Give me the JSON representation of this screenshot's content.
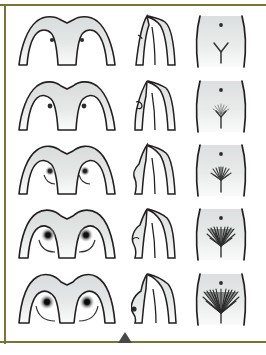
{
  "figure": {
    "type": "medical-development-stage-chart",
    "title": "",
    "frame": {
      "rule_color": "#7b7333",
      "marker_color": "#474747",
      "marker_shape": "triangle-up",
      "background": "#ffffff"
    },
    "render": {
      "skin_fill": "#e2e4e4",
      "skin_fill_light": "#f3f4f4",
      "outline_color": "#231f20",
      "detail_color": "#3a3a3a",
      "hair_color": "#4a4a4a"
    },
    "columns": [
      {
        "id": "frontal",
        "label": "Frontal view"
      },
      {
        "id": "profile",
        "label": "Side profile view"
      },
      {
        "id": "pubic",
        "label": "Pubic region view"
      }
    ],
    "rows": [
      {
        "stage": 1,
        "label": "Stage 1",
        "frontal": {
          "breast": "flat / prepubertal",
          "nipple": "small dot",
          "areola": "none"
        },
        "profile": {
          "contour": "flat chest wall"
        },
        "pubic": {
          "hair": "none",
          "hair_density": 0,
          "cleft": "Y-shape",
          "navel": "dot"
        }
      },
      {
        "stage": 2,
        "label": "Stage 2",
        "frontal": {
          "breast": "breast bud",
          "nipple": "small dot",
          "areola": "slight"
        },
        "profile": {
          "contour": "small bud elevation"
        },
        "pubic": {
          "hair": "sparse",
          "hair_density": 1,
          "cleft": "Y-shape",
          "navel": "dot"
        }
      },
      {
        "stage": 3,
        "label": "Stage 3",
        "frontal": {
          "breast": "enlarging mound",
          "nipple": "dot with areola",
          "areola": "enlarging"
        },
        "profile": {
          "contour": "conical mound"
        },
        "pubic": {
          "hair": "darker, coarser",
          "hair_density": 2,
          "cleft": "Y-shape",
          "navel": "dot"
        }
      },
      {
        "stage": 4,
        "label": "Stage 4",
        "frontal": {
          "breast": "areola mound projects",
          "nipple": "prominent dark",
          "areola": "secondary mound"
        },
        "profile": {
          "contour": "double contour"
        },
        "pubic": {
          "hair": "adult type, smaller area",
          "hair_density": 3,
          "cleft": "Y-shape",
          "navel": "dot"
        }
      },
      {
        "stage": 5,
        "label": "Stage 5",
        "frontal": {
          "breast": "mature adult",
          "nipple": "projecting dark",
          "areola": "recessed to contour"
        },
        "profile": {
          "contour": "mature pendulous"
        },
        "pubic": {
          "hair": "adult triangle, full",
          "hair_density": 4,
          "cleft": "Y-shape",
          "navel": "dot"
        }
      }
    ]
  }
}
